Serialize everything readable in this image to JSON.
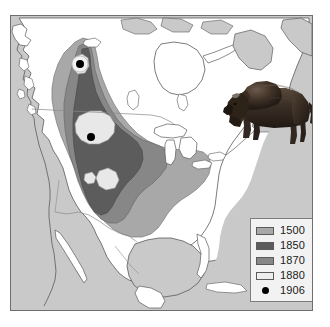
{
  "figure": {
    "background_color": "#ffffff",
    "frame_color": "#6e6e6e"
  },
  "map": {
    "name": "north-america-bison-range-map",
    "projection_hint": "north america, conic",
    "land_fill": "#ffffff",
    "ocean_fill": "#c9c9c9",
    "coastline_color": "#5a5a5a",
    "border_color": "#8a8a8a",
    "features": [
      {
        "name": "great-lakes",
        "fill": "#ffffff",
        "outline": "#5a5a5a"
      },
      {
        "name": "hudson-bay",
        "fill": "#ffffff",
        "outline": "#5a5a5a"
      },
      {
        "name": "gulf-of-mexico",
        "fill": "#c9c9c9",
        "outline": "#5a5a5a"
      },
      {
        "name": "usa-canada-border",
        "type": "line"
      },
      {
        "name": "usa-mexico-border",
        "type": "line"
      }
    ]
  },
  "range_layers": [
    {
      "year": "1500",
      "name": "range-1500",
      "color": "#a8a8a8",
      "description": "original pre-contact range, largest extent"
    },
    {
      "year": "1850",
      "name": "range-1850",
      "color": "#5c5c5c",
      "description": "range after early westward expansion"
    },
    {
      "year": "1870",
      "name": "range-1870",
      "color": "#878787",
      "description": "range after near-collapse of southern herd"
    },
    {
      "year": "1880",
      "name": "range-1880",
      "color": "#e8e8e8",
      "description": "small remnant pockets"
    },
    {
      "year": "1906",
      "name": "range-1906",
      "color": "#000000",
      "description": "two surviving wild herd locations"
    }
  ],
  "relict_herds_1906": [
    {
      "name": "herd-point-north",
      "label": "1906",
      "map_x": 69,
      "map_y": 48
    },
    {
      "name": "herd-point-south",
      "label": "1906",
      "map_x": 80,
      "map_y": 121
    }
  ],
  "legend": {
    "name": "map-legend",
    "background_color": "#f2f2f2",
    "border_color": "#7d7d7d",
    "entries": [
      {
        "label": "1500",
        "swatch": "#a8a8a8",
        "type": "area"
      },
      {
        "label": "1850",
        "swatch": "#5c5c5c",
        "type": "area"
      },
      {
        "label": "1870",
        "swatch": "#878787",
        "type": "area"
      },
      {
        "label": "1880",
        "swatch": "#eeeeee",
        "type": "area"
      },
      {
        "label": "1906",
        "swatch": "#000000",
        "type": "point"
      }
    ]
  },
  "illustration": {
    "name": "bison-illustration",
    "subject": "american bison",
    "body_color": "#2a211c",
    "shade_color": "#4a3c33",
    "highlight_color": "#6b5a4c"
  }
}
